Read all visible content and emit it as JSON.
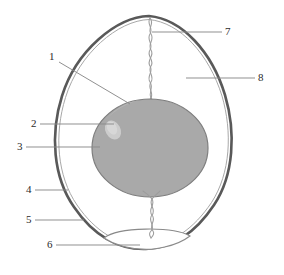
{
  "figure": {
    "background_color": "#ffffff",
    "shell_color": "#595959",
    "membrane_color": "#8c8c8c",
    "yolk_fill": "#a9a9a9",
    "yolk_outline": "#808080",
    "germinal_disc_color": "#c6c6c6",
    "chalaza_color": "#9a9a9a",
    "air_cell_color": "#8a8a8a",
    "leader_line_color": "#8a8a8a",
    "label_text_color": "#2b2b2b"
  },
  "labels": [
    {
      "id": "1",
      "text": "1",
      "x": 49,
      "y": 57,
      "target": "yolk-upper-left",
      "leader": "diagonal-down-right"
    },
    {
      "id": "2",
      "text": "2",
      "x": 31,
      "y": 120,
      "target": "germinal-disc",
      "leader": "horizontal-right"
    },
    {
      "id": "3",
      "text": "3",
      "x": 17,
      "y": 143,
      "target": "yolk-left-edge",
      "leader": "horizontal-right"
    },
    {
      "id": "4",
      "text": "4",
      "x": 26,
      "y": 186,
      "target": "shell-left-lower",
      "leader": "horizontal-right"
    },
    {
      "id": "5",
      "text": "5",
      "x": 26,
      "y": 216,
      "target": "shell-membrane-lower-left",
      "leader": "horizontal-right"
    },
    {
      "id": "6",
      "text": "6",
      "x": 47,
      "y": 241,
      "target": "air-cell",
      "leader": "horizontal-right"
    },
    {
      "id": "7",
      "text": "7",
      "x": 225,
      "y": 27,
      "target": "chalaza-upper",
      "leader": "horizontal-left"
    },
    {
      "id": "8",
      "text": "8",
      "x": 258,
      "y": 74,
      "target": "albumen",
      "leader": "horizontal-left"
    }
  ],
  "parts": {
    "shell": "egg-shell-outline",
    "albumen": "egg-white-interior",
    "yolk": "yolk-ellipse",
    "germinal_disc": "germinal-disc-highlight",
    "chalaza_top": "upper-chalaza-cord",
    "chalaza_bottom": "lower-chalaza-cord",
    "air_cell": "air-cell-lens"
  }
}
